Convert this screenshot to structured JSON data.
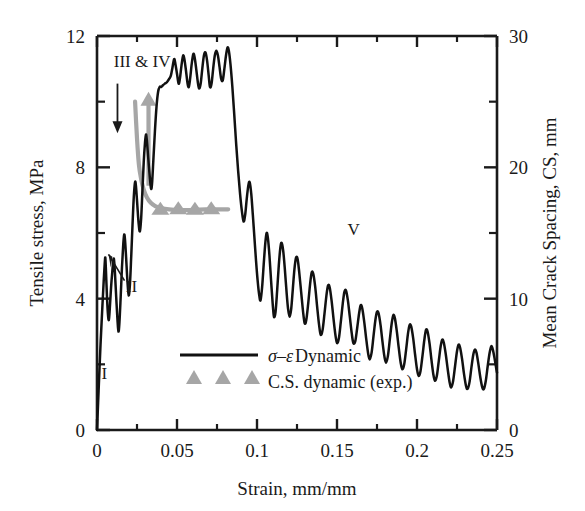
{
  "chart_data": {
    "type": "line",
    "title": "",
    "xlabel": "Strain, mm/mm",
    "ylabel": "Tensile stress, MPa",
    "y2label": "Mean Crack Spacing, CS, mm",
    "xlim": [
      0,
      0.25
    ],
    "ylim": [
      0,
      12
    ],
    "y2lim": [
      0,
      30
    ],
    "xticks": [
      0,
      0.05,
      0.1,
      0.15,
      0.2,
      0.25
    ],
    "xticklabels": [
      "0",
      "0.05",
      "0.1",
      "0.15",
      "0.2",
      "0.25"
    ],
    "yticks": [
      0,
      4,
      8,
      12
    ],
    "yticklabels": [
      "0",
      "4",
      "8",
      "12"
    ],
    "yminorticks": [
      2,
      6,
      10
    ],
    "y2ticks": [
      0,
      10,
      20,
      30
    ],
    "y2ticklabels": [
      "0",
      "10",
      "20",
      "30"
    ],
    "y2minorticks": [
      5,
      15,
      25
    ],
    "xminorticks": [
      0.025,
      0.075,
      0.125,
      0.175,
      0.225
    ],
    "grid": false,
    "legend_position": "lower-center-left",
    "series": [
      {
        "name": "sigma-epsilon Dynamic",
        "label_symbol": "σ–ε",
        "label_rest": " Dynamic",
        "type": "line",
        "color": "#111111",
        "axis": "left",
        "points": [
          [
            0.0,
            0.0
          ],
          [
            0.001,
            1.2
          ],
          [
            0.0022,
            2.6
          ],
          [
            0.0034,
            3.8
          ],
          [
            0.0042,
            4.55
          ],
          [
            0.0048,
            5.05
          ],
          [
            0.0052,
            5.25
          ],
          [
            0.0056,
            4.85
          ],
          [
            0.0062,
            4.1
          ],
          [
            0.0068,
            3.55
          ],
          [
            0.0074,
            3.35
          ],
          [
            0.008,
            3.7
          ],
          [
            0.0088,
            4.35
          ],
          [
            0.0096,
            4.85
          ],
          [
            0.0102,
            5.15
          ],
          [
            0.0106,
            5.2
          ],
          [
            0.0112,
            4.8
          ],
          [
            0.012,
            4.05
          ],
          [
            0.0128,
            3.35
          ],
          [
            0.0134,
            3.0
          ],
          [
            0.014,
            3.25
          ],
          [
            0.0148,
            4.05
          ],
          [
            0.0156,
            4.95
          ],
          [
            0.0164,
            5.65
          ],
          [
            0.017,
            5.95
          ],
          [
            0.0175,
            5.8
          ],
          [
            0.0182,
            5.25
          ],
          [
            0.019,
            4.55
          ],
          [
            0.0198,
            4.1
          ],
          [
            0.0206,
            4.45
          ],
          [
            0.0214,
            5.3
          ],
          [
            0.0222,
            6.25
          ],
          [
            0.023,
            7.1
          ],
          [
            0.0238,
            7.55
          ],
          [
            0.0244,
            7.4
          ],
          [
            0.0252,
            6.85
          ],
          [
            0.026,
            6.3
          ],
          [
            0.0268,
            6.05
          ],
          [
            0.0276,
            6.45
          ],
          [
            0.0284,
            7.3
          ],
          [
            0.0292,
            8.15
          ],
          [
            0.03,
            8.75
          ],
          [
            0.0306,
            9.0
          ],
          [
            0.0312,
            8.8
          ],
          [
            0.032,
            8.3
          ],
          [
            0.033,
            7.7
          ],
          [
            0.0338,
            7.35
          ],
          [
            0.0344,
            7.5
          ],
          [
            0.0352,
            8.2
          ],
          [
            0.0362,
            9.1
          ],
          [
            0.0372,
            9.85
          ],
          [
            0.0382,
            10.3
          ],
          [
            0.0392,
            10.45
          ],
          [
            0.0402,
            10.45
          ],
          [
            0.0412,
            10.5
          ],
          [
            0.0424,
            10.55
          ],
          [
            0.0438,
            10.6
          ],
          [
            0.0452,
            10.7
          ],
          [
            0.0462,
            10.8
          ],
          [
            0.0472,
            11.05
          ],
          [
            0.0482,
            11.3
          ],
          [
            0.049,
            11.15
          ],
          [
            0.05,
            10.85
          ],
          [
            0.051,
            10.55
          ],
          [
            0.0518,
            10.7
          ],
          [
            0.0528,
            11.1
          ],
          [
            0.0538,
            11.4
          ],
          [
            0.0546,
            11.3
          ],
          [
            0.0556,
            10.95
          ],
          [
            0.0566,
            10.55
          ],
          [
            0.0574,
            10.45
          ],
          [
            0.0582,
            10.7
          ],
          [
            0.0592,
            11.15
          ],
          [
            0.0602,
            11.45
          ],
          [
            0.061,
            11.35
          ],
          [
            0.062,
            11.0
          ],
          [
            0.063,
            10.6
          ],
          [
            0.0638,
            10.4
          ],
          [
            0.0648,
            10.55
          ],
          [
            0.0658,
            11.0
          ],
          [
            0.0668,
            11.4
          ],
          [
            0.0678,
            11.5
          ],
          [
            0.0688,
            11.25
          ],
          [
            0.0698,
            10.8
          ],
          [
            0.0706,
            10.45
          ],
          [
            0.0716,
            10.55
          ],
          [
            0.0726,
            11.0
          ],
          [
            0.0736,
            11.4
          ],
          [
            0.0746,
            11.55
          ],
          [
            0.0756,
            11.4
          ],
          [
            0.0766,
            11.05
          ],
          [
            0.0776,
            10.7
          ],
          [
            0.0786,
            10.65
          ],
          [
            0.0796,
            11.0
          ],
          [
            0.0806,
            11.4
          ],
          [
            0.0816,
            11.65
          ],
          [
            0.0824,
            11.55
          ],
          [
            0.0834,
            11.15
          ],
          [
            0.0846,
            10.45
          ],
          [
            0.0858,
            9.6
          ],
          [
            0.087,
            8.7
          ],
          [
            0.0882,
            7.9
          ],
          [
            0.0894,
            7.2
          ],
          [
            0.0906,
            6.65
          ],
          [
            0.0916,
            6.35
          ],
          [
            0.0926,
            6.55
          ],
          [
            0.0936,
            7.05
          ],
          [
            0.0946,
            7.45
          ],
          [
            0.0954,
            7.55
          ],
          [
            0.0964,
            7.2
          ],
          [
            0.0974,
            6.55
          ],
          [
            0.0984,
            5.85
          ],
          [
            0.0994,
            5.15
          ],
          [
            0.1004,
            4.55
          ],
          [
            0.1014,
            4.1
          ],
          [
            0.1022,
            3.95
          ],
          [
            0.1032,
            4.35
          ],
          [
            0.1042,
            5.05
          ],
          [
            0.1052,
            5.7
          ],
          [
            0.106,
            6.0
          ],
          [
            0.1068,
            5.85
          ],
          [
            0.1078,
            5.3
          ],
          [
            0.1088,
            4.55
          ],
          [
            0.1098,
            3.85
          ],
          [
            0.1106,
            3.45
          ],
          [
            0.1116,
            3.6
          ],
          [
            0.1126,
            4.25
          ],
          [
            0.1136,
            5.0
          ],
          [
            0.1146,
            5.55
          ],
          [
            0.1154,
            5.7
          ],
          [
            0.1164,
            5.45
          ],
          [
            0.1174,
            4.9
          ],
          [
            0.1184,
            4.25
          ],
          [
            0.1194,
            3.7
          ],
          [
            0.1204,
            3.45
          ],
          [
            0.1214,
            3.7
          ],
          [
            0.1224,
            4.3
          ],
          [
            0.1234,
            4.9
          ],
          [
            0.1244,
            5.25
          ],
          [
            0.1254,
            5.2
          ],
          [
            0.1264,
            4.8
          ],
          [
            0.1276,
            4.2
          ],
          [
            0.1288,
            3.6
          ],
          [
            0.1298,
            3.25
          ],
          [
            0.1308,
            3.35
          ],
          [
            0.132,
            3.85
          ],
          [
            0.1332,
            4.45
          ],
          [
            0.1342,
            4.8
          ],
          [
            0.1352,
            4.75
          ],
          [
            0.1364,
            4.35
          ],
          [
            0.1376,
            3.75
          ],
          [
            0.1388,
            3.2
          ],
          [
            0.1398,
            2.9
          ],
          [
            0.141,
            3.05
          ],
          [
            0.1422,
            3.55
          ],
          [
            0.1434,
            4.1
          ],
          [
            0.1444,
            4.4
          ],
          [
            0.1454,
            4.35
          ],
          [
            0.1466,
            3.95
          ],
          [
            0.1478,
            3.4
          ],
          [
            0.149,
            2.9
          ],
          [
            0.15,
            2.65
          ],
          [
            0.1512,
            2.8
          ],
          [
            0.1524,
            3.3
          ],
          [
            0.1536,
            3.85
          ],
          [
            0.1546,
            4.2
          ],
          [
            0.1556,
            4.25
          ],
          [
            0.1568,
            3.95
          ],
          [
            0.158,
            3.45
          ],
          [
            0.1592,
            2.95
          ],
          [
            0.1602,
            2.65
          ],
          [
            0.1614,
            2.7
          ],
          [
            0.1626,
            3.1
          ],
          [
            0.1638,
            3.55
          ],
          [
            0.1648,
            3.8
          ],
          [
            0.1658,
            3.7
          ],
          [
            0.167,
            3.3
          ],
          [
            0.1682,
            2.8
          ],
          [
            0.1694,
            2.35
          ],
          [
            0.1704,
            2.15
          ],
          [
            0.1716,
            2.35
          ],
          [
            0.1728,
            2.85
          ],
          [
            0.174,
            3.35
          ],
          [
            0.175,
            3.6
          ],
          [
            0.176,
            3.55
          ],
          [
            0.1772,
            3.2
          ],
          [
            0.1784,
            2.7
          ],
          [
            0.1796,
            2.25
          ],
          [
            0.1806,
            2.05
          ],
          [
            0.1818,
            2.25
          ],
          [
            0.183,
            2.75
          ],
          [
            0.1842,
            3.25
          ],
          [
            0.1852,
            3.5
          ],
          [
            0.1862,
            3.4
          ],
          [
            0.1874,
            3.0
          ],
          [
            0.1886,
            2.5
          ],
          [
            0.1898,
            2.05
          ],
          [
            0.1908,
            1.85
          ],
          [
            0.192,
            2.0
          ],
          [
            0.1932,
            2.45
          ],
          [
            0.1944,
            2.95
          ],
          [
            0.1954,
            3.2
          ],
          [
            0.1964,
            3.15
          ],
          [
            0.1976,
            2.8
          ],
          [
            0.1988,
            2.3
          ],
          [
            0.2,
            1.85
          ],
          [
            0.201,
            1.65
          ],
          [
            0.2022,
            1.8
          ],
          [
            0.2034,
            2.25
          ],
          [
            0.2046,
            2.75
          ],
          [
            0.2056,
            3.05
          ],
          [
            0.2066,
            3.0
          ],
          [
            0.2078,
            2.65
          ],
          [
            0.209,
            2.15
          ],
          [
            0.2102,
            1.7
          ],
          [
            0.2112,
            1.5
          ],
          [
            0.2124,
            1.65
          ],
          [
            0.2136,
            2.1
          ],
          [
            0.2148,
            2.55
          ],
          [
            0.2158,
            2.75
          ],
          [
            0.2168,
            2.65
          ],
          [
            0.218,
            2.3
          ],
          [
            0.2192,
            1.85
          ],
          [
            0.2204,
            1.45
          ],
          [
            0.2214,
            1.3
          ],
          [
            0.2226,
            1.5
          ],
          [
            0.2238,
            1.95
          ],
          [
            0.225,
            2.4
          ],
          [
            0.226,
            2.6
          ],
          [
            0.227,
            2.5
          ],
          [
            0.2282,
            2.15
          ],
          [
            0.2294,
            1.7
          ],
          [
            0.2306,
            1.35
          ],
          [
            0.2316,
            1.25
          ],
          [
            0.2328,
            1.45
          ],
          [
            0.234,
            1.9
          ],
          [
            0.2352,
            2.3
          ],
          [
            0.2362,
            2.45
          ],
          [
            0.2372,
            2.35
          ],
          [
            0.2384,
            2.0
          ],
          [
            0.2396,
            1.6
          ],
          [
            0.2408,
            1.3
          ],
          [
            0.2418,
            1.25
          ],
          [
            0.243,
            1.5
          ],
          [
            0.2442,
            1.95
          ],
          [
            0.2454,
            2.35
          ],
          [
            0.2464,
            2.55
          ],
          [
            0.2474,
            2.45
          ],
          [
            0.2486,
            2.15
          ],
          [
            0.2496,
            1.85
          ],
          [
            0.25,
            1.75
          ]
        ]
      },
      {
        "name": "C.S. dynamic (exp.)",
        "label_rest": "C.S. dynamic (exp.)",
        "type": "scatter+line",
        "color": "#a6a6a6",
        "axis": "right",
        "curve_points": [
          [
            0.0238,
            25.0
          ],
          [
            0.025,
            22.2
          ],
          [
            0.0262,
            20.2
          ],
          [
            0.0276,
            19.1
          ],
          [
            0.0292,
            18.3
          ],
          [
            0.0312,
            17.7
          ],
          [
            0.0336,
            17.3
          ],
          [
            0.0364,
            17.05
          ],
          [
            0.04,
            16.9
          ],
          [
            0.045,
            16.8
          ],
          [
            0.052,
            16.75
          ],
          [
            0.06,
            16.75
          ],
          [
            0.068,
            16.8
          ],
          [
            0.076,
            16.8
          ],
          [
            0.082,
            16.8
          ]
        ],
        "markers": [
          [
            0.0396,
            16.8
          ],
          [
            0.0508,
            16.85
          ],
          [
            0.0612,
            16.8
          ],
          [
            0.0714,
            16.85
          ]
        ],
        "arrow": {
          "x": 0.0322,
          "y_from": 18.6,
          "y_to": 25.6
        }
      }
    ],
    "annotations": [
      {
        "text": "III & IV",
        "x": 0.0105,
        "y": 11.05
      },
      {
        "text": "II",
        "x": 0.018,
        "y": 4.2
      },
      {
        "text": "I",
        "x": 0.0028,
        "y": 1.55
      },
      {
        "text": "V",
        "x": 0.1565,
        "y": 5.95
      }
    ],
    "region_arrow": {
      "x": 0.0128,
      "y_from": 10.55,
      "y_to": 9.1
    }
  },
  "legend": {
    "entries": [
      {
        "symbol": "σ–ε",
        "text": " Dynamic",
        "marker": "line",
        "color": "#111111"
      },
      {
        "symbol": "",
        "text": "C.S. dynamic (exp.)",
        "marker": "triangles",
        "color": "#a6a6a6"
      }
    ]
  },
  "colors": {
    "curve": "#111111",
    "crack_spacing": "#a6a6a6",
    "axis": "#1a1a1a",
    "background": "#ffffff"
  }
}
